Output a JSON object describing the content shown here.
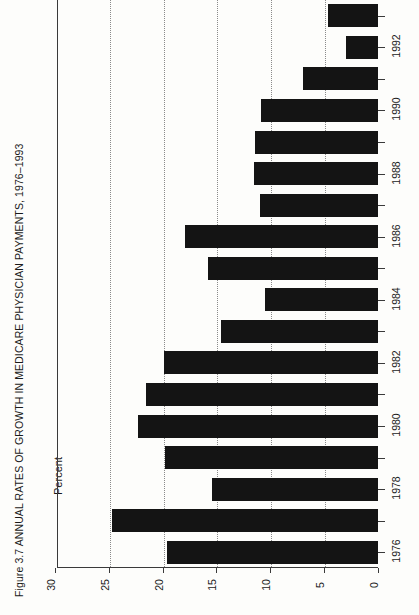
{
  "figure": {
    "number": "Figure 3.7",
    "title": "ANNUAL RATES OF GROWTH IN MEDICARE PHYSICIAN PAYMENTS, 1976–1993",
    "caption_full": "Figure 3.7  ANNUAL RATES OF GROWTH IN MEDICARE PHYSICIAN PAYMENTS, 1976–1993"
  },
  "axis": {
    "value_axis_title": "Percent",
    "value_ticks": [
      "30",
      "25",
      "20",
      "15",
      "10",
      "5",
      "0"
    ],
    "category_ticks_labeled": [
      "1976",
      "1978",
      "1980",
      "1982",
      "1984",
      "1986",
      "1988",
      "1990",
      "1992"
    ]
  },
  "style": {
    "bar_color": "#141414",
    "axis_color": "#3a3a3a",
    "grid_color": "#8a8a8a",
    "background": "#fdfdfb"
  },
  "chart_data": {
    "type": "bar",
    "orientation": "horizontal",
    "title": "Figure 3.7  ANNUAL RATES OF GROWTH IN MEDICARE PHYSICIAN PAYMENTS, 1976–1993",
    "xlabel": "Percent",
    "ylabel": "",
    "xlim": [
      0,
      30
    ],
    "x_ticks": [
      30,
      25,
      20,
      15,
      10,
      5,
      0
    ],
    "x_tick_direction": "descending-left-to-right",
    "grid": "dotted vertical gridlines at 25, 20, 15, 10, 5",
    "legend": "none",
    "categories": [
      "1976",
      "1977",
      "1978",
      "1979",
      "1980",
      "1981",
      "1982",
      "1983",
      "1984",
      "1985",
      "1986",
      "1987",
      "1988",
      "1989",
      "1990",
      "1991",
      "1992",
      "1993"
    ],
    "values": [
      19.6,
      24.7,
      15.4,
      19.8,
      22.3,
      21.5,
      19.9,
      14.6,
      10.5,
      15.8,
      17.9,
      11.0,
      11.5,
      11.4,
      10.9,
      7.0,
      3.0,
      4.6
    ],
    "series": [
      {
        "name": "Annual rate of growth in Medicare physician payments (percent)",
        "values": [
          19.6,
          24.7,
          15.4,
          19.8,
          22.3,
          21.5,
          19.9,
          14.6,
          10.5,
          15.8,
          17.9,
          11.0,
          11.5,
          11.4,
          10.9,
          7.0,
          3.0,
          4.6
        ]
      }
    ]
  }
}
